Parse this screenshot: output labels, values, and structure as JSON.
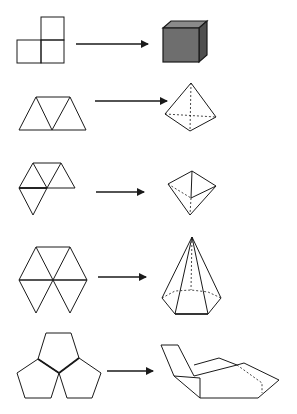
{
  "diagram": {
    "colors": {
      "stroke": "#1a1a1a",
      "cube_front": "#6e6e6e",
      "cube_top": "#8a8a8a",
      "cube_side": "#4f4f4f",
      "background": "#ffffff"
    },
    "rows": [
      {
        "net": "three-square-corner-net",
        "solid": "cube"
      },
      {
        "net": "four-triangle-strip-net",
        "solid": "tetrahedron"
      },
      {
        "net": "five-triangle-net",
        "solid": "square-pyramid"
      },
      {
        "net": "hexagon-of-six-triangles-net",
        "solid": "hexagonal-pyramid"
      },
      {
        "net": "three-pentagon-net",
        "solid": "folded-pentagon-corner"
      }
    ]
  }
}
